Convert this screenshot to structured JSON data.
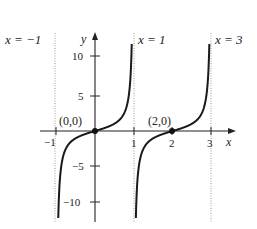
{
  "chart_data": {
    "type": "line",
    "title": "",
    "function": "y = tan(pi*x/2)",
    "xlabel": "x",
    "ylabel": "y",
    "xlim": [
      -1.2,
      3.6
    ],
    "ylim": [
      -12,
      13
    ],
    "x_ticks": [
      -1,
      1,
      2,
      3
    ],
    "x_tick_labels": [
      "−1",
      "1",
      "2",
      "3"
    ],
    "y_ticks": [
      10,
      5,
      -5,
      -10
    ],
    "y_tick_labels": [
      "10",
      "5",
      "−5",
      "−10"
    ],
    "asymptotes": [
      {
        "x": -1,
        "label": "x = −1"
      },
      {
        "x": 1,
        "label": "x = 1"
      },
      {
        "x": 3,
        "label": "x = 3"
      }
    ],
    "points": [
      {
        "x": 0,
        "y": 0,
        "label": "(0,0)"
      },
      {
        "x": 2,
        "y": 0,
        "label": "(2,0)"
      }
    ],
    "series": [
      {
        "name": "branch (-1,1)",
        "domain": [
          -1,
          1
        ]
      },
      {
        "name": "branch (1,3)",
        "domain": [
          1,
          3
        ]
      }
    ],
    "grid": false,
    "colors": {
      "curve": "#1a1a1a",
      "axis": "#222222",
      "asymptote": "#9a9a9a"
    }
  },
  "labels": {
    "asym_m1": "x = −1",
    "asym_1": "x = 1",
    "asym_3": "x = 3",
    "pt0": "(0,0)",
    "pt2": "(2,0)",
    "xaxis": "x",
    "yaxis": "y",
    "xt_m1": "−1",
    "xt_1": "1",
    "xt_2": "2",
    "xt_3": "3",
    "yt_10": "10",
    "yt_5": "5",
    "yt_m5": "−5",
    "yt_m10": "−10"
  }
}
